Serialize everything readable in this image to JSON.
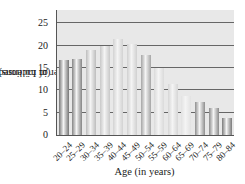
{
  "chart_data": {
    "type": "bar",
    "title": "",
    "xlabel": "Age (in years)",
    "ylabel_line1": "Number of Licensed Drivers",
    "ylabel_line2": "(in millions)",
    "categories": [
      "20–24",
      "25–29",
      "30–34",
      "35–39",
      "40–44",
      "45–49",
      "50–54",
      "55–59",
      "60–64",
      "65–69",
      "70–74",
      "75–79",
      "80–84"
    ],
    "values": [
      16.8,
      17.1,
      19.0,
      20.0,
      21.4,
      20.4,
      18.0,
      15.0,
      11.5,
      8.7,
      7.4,
      6.1,
      3.9
    ],
    "ylim": [
      0,
      28
    ],
    "yticks": [
      0,
      5,
      10,
      15,
      20,
      25
    ],
    "grid": true,
    "bar_colors": [
      "#777777",
      "#858585",
      "#bdbdbd",
      "#c8c8c8",
      "#d2d2d2",
      "#d0d0d0",
      "#a5a5a5",
      "#dadada",
      "#d6d6d6",
      "#e2e2e2",
      "#8e8e8e",
      "#8a8a8a",
      "#7a7a7a"
    ]
  }
}
